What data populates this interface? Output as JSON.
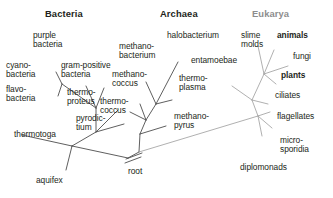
{
  "figure": {
    "kind": "unrooted-phylogenetic-tree",
    "title_visible": false,
    "colors": {
      "background": "#ffffff",
      "branch_dark": "#4d4d4d",
      "branch_light": "#a7a7a7",
      "text_dark": "#231f20",
      "text_gray": "#8d8d8d"
    }
  },
  "domains": [
    {
      "id": "bacteria",
      "label": "Bacteria",
      "style": "dark"
    },
    {
      "id": "archaea",
      "label": "Archaea",
      "style": "dark"
    },
    {
      "id": "eukarya",
      "label": "Eukarya",
      "style": "gray"
    }
  ],
  "root": {
    "label": "root"
  },
  "taxa": {
    "bacteria": [
      {
        "label": "purple\nbacteria",
        "emphasis": "normal"
      },
      {
        "label": "cyano-\nbacteria",
        "emphasis": "normal"
      },
      {
        "label": "gram-positive\nbacteria",
        "emphasis": "normal"
      },
      {
        "label": "flavo-\nbacteria",
        "emphasis": "normal"
      },
      {
        "label": "thermo-\nproteus",
        "emphasis": "normal"
      },
      {
        "label": "pyrodic-\ntium",
        "emphasis": "normal"
      },
      {
        "label": "thermotoga",
        "emphasis": "normal"
      },
      {
        "label": "aquifex",
        "emphasis": "normal"
      }
    ],
    "archaea": [
      {
        "label": "halobacterium",
        "emphasis": "normal"
      },
      {
        "label": "methano-\nbacterium",
        "emphasis": "normal"
      },
      {
        "label": "methano-\ncoccus",
        "emphasis": "normal"
      },
      {
        "label": "thermo-\ncoccus",
        "emphasis": "normal"
      },
      {
        "label": "thermo-\nplasma",
        "emphasis": "normal"
      },
      {
        "label": "methano-\npyrus",
        "emphasis": "normal"
      }
    ],
    "eukarya": [
      {
        "label": "entamoebae",
        "emphasis": "normal"
      },
      {
        "label": "slime\nmolds",
        "emphasis": "normal"
      },
      {
        "label": "animals",
        "emphasis": "bold"
      },
      {
        "label": "fungi",
        "emphasis": "normal"
      },
      {
        "label": "plants",
        "emphasis": "bold"
      },
      {
        "label": "ciliates",
        "emphasis": "normal"
      },
      {
        "label": "flagellates",
        "emphasis": "normal"
      },
      {
        "label": "micro-\nsporidia",
        "emphasis": "normal"
      },
      {
        "label": "diplomonads",
        "emphasis": "normal"
      }
    ]
  },
  "labels": {
    "purple_bacteria": "purple\nbacteria",
    "cyano_bacteria": "cyano-\nbacteria",
    "gram_positive": "gram-positive\nbacteria",
    "flavo_bacteria": "flavo-\nbacteria",
    "thermoproteus": "thermo-\nproteus",
    "pyrodictium": "pyrodic-\ntium",
    "thermotoga": "thermotoga",
    "aquifex": "aquifex",
    "halobacterium": "halobacterium",
    "methanobacterium": "methano-\nbacterium",
    "methanococcus": "methano-\ncoccus",
    "thermococcus": "thermo-\ncoccus",
    "thermoplasma": "thermo-\nplasma",
    "methanopyrus": "methano-\npyrus",
    "entamoebae": "entamoebae",
    "slime_molds": "slime\nmolds",
    "animals": "animals",
    "fungi": "fungi",
    "plants": "plants",
    "ciliates": "ciliates",
    "flagellates": "flagellates",
    "microsporidia": "micro-\nsporidia",
    "diplomonads": "diplomonads",
    "root": "root",
    "bacteria": "Bacteria",
    "archaea": "Archaea",
    "eukarya": "Eukarya"
  }
}
